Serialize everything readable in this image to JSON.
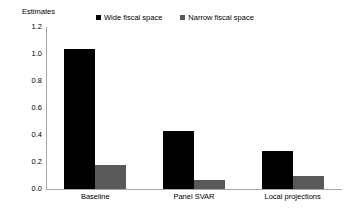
{
  "axis_title": "Estimates",
  "legend": {
    "position": "top",
    "entries": [
      {
        "label": "Wide fiscal space",
        "color": "#000000",
        "marker": "square-marker"
      },
      {
        "label": "Narrow fiscal space",
        "color": "#595959",
        "marker": "square-marker"
      }
    ]
  },
  "y_ticks": [
    "1.2",
    "1.0",
    "0.8",
    "0.6",
    "0.4",
    "0.2",
    "0.0"
  ],
  "chart_data": {
    "type": "bar",
    "title": "",
    "subtitle": "",
    "xlabel": "",
    "ylabel": "Estimates",
    "ylim": [
      0,
      1.2
    ],
    "ytick_values": [
      1.2,
      1.0,
      0.8,
      0.6,
      0.4,
      0.2,
      0.0
    ],
    "grid": false,
    "legend_position": "top",
    "categories": [
      "Baseline",
      "Panel SVAR",
      "Local projections"
    ],
    "series": [
      {
        "name": "Wide fiscal space",
        "color": "#000000",
        "values": [
          1.04,
          0.43,
          0.28
        ]
      },
      {
        "name": "Narrow fiscal space",
        "color": "#595959",
        "values": [
          0.18,
          0.07,
          0.1
        ]
      }
    ]
  }
}
